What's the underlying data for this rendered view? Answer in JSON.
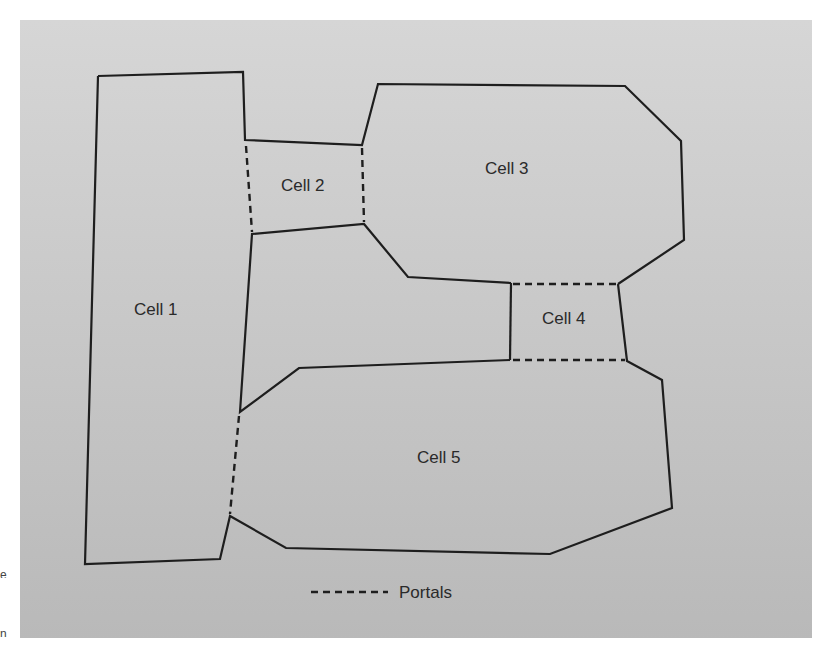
{
  "figure": {
    "background": "#c9c9c9",
    "stroke_color": "#1e1e1e",
    "text_color": "#2a2a2a"
  },
  "cells": [
    {
      "id": "cell-1",
      "label": "Cell 1",
      "label_pos": [
        162,
        309
      ],
      "polygon": [
        [
          98,
          76
        ],
        [
          243,
          72
        ],
        [
          245,
          145
        ],
        [
          252,
          234
        ],
        [
          240,
          412
        ],
        [
          230,
          516
        ],
        [
          220,
          559
        ],
        [
          85,
          564
        ]
      ]
    },
    {
      "id": "cell-2",
      "label": "Cell 2",
      "label_pos": [
        309,
        185
      ],
      "polygon": [
        [
          245,
          140
        ],
        [
          362,
          145
        ],
        [
          364,
          224
        ],
        [
          252,
          234
        ]
      ]
    },
    {
      "id": "cell-3",
      "label": "Cell 3",
      "label_pos": [
        513,
        168
      ],
      "polygon": [
        [
          378,
          84
        ],
        [
          625,
          86
        ],
        [
          681,
          141
        ],
        [
          684,
          240
        ],
        [
          618,
          284
        ],
        [
          511,
          283
        ],
        [
          408,
          277
        ],
        [
          364,
          224
        ],
        [
          362,
          145
        ]
      ]
    },
    {
      "id": "cell-4",
      "label": "Cell 4",
      "label_pos": [
        569,
        318
      ],
      "polygon": [
        [
          511,
          283
        ],
        [
          618,
          284
        ],
        [
          627,
          361
        ],
        [
          510,
          360
        ]
      ]
    },
    {
      "id": "cell-5",
      "label": "Cell 5",
      "label_pos": [
        445,
        457
      ],
      "polygon": [
        [
          240,
          412
        ],
        [
          299,
          368
        ],
        [
          510,
          360
        ],
        [
          627,
          361
        ],
        [
          662,
          380
        ],
        [
          672,
          508
        ],
        [
          550,
          554
        ],
        [
          286,
          548
        ],
        [
          230,
          516
        ]
      ]
    }
  ],
  "walls": [
    [
      [
        98,
        76
      ],
      [
        243,
        72
      ],
      [
        245,
        140
      ],
      [
        362,
        145
      ],
      [
        378,
        84
      ],
      [
        625,
        86
      ],
      [
        681,
        141
      ],
      [
        684,
        240
      ],
      [
        618,
        284
      ]
    ],
    [
      [
        511,
        283
      ],
      [
        408,
        277
      ],
      [
        364,
        224
      ],
      [
        252,
        234
      ],
      [
        240,
        412
      ],
      [
        299,
        368
      ],
      [
        510,
        360
      ]
    ],
    [
      [
        511,
        283
      ],
      [
        510,
        360
      ]
    ],
    [
      [
        618,
        284
      ],
      [
        627,
        361
      ],
      [
        662,
        380
      ],
      [
        672,
        508
      ],
      [
        550,
        554
      ],
      [
        286,
        548
      ],
      [
        230,
        516
      ],
      [
        220,
        559
      ],
      [
        85,
        564
      ],
      [
        98,
        76
      ]
    ]
  ],
  "portals": [
    {
      "id": "portal-1-2",
      "from": [
        246,
        146
      ],
      "to": [
        252,
        232
      ]
    },
    {
      "id": "portal-2-3",
      "from": [
        362,
        148
      ],
      "to": [
        364,
        222
      ]
    },
    {
      "id": "portal-3-4",
      "from": [
        513,
        284
      ],
      "to": [
        616,
        284
      ]
    },
    {
      "id": "portal-4-5",
      "from": [
        513,
        360
      ],
      "to": [
        625,
        360
      ]
    },
    {
      "id": "portal-1-5",
      "from": [
        239,
        416
      ],
      "to": [
        230,
        514
      ]
    }
  ],
  "legend": {
    "label": "Portals",
    "swatch": "dashed-line",
    "line_from": [
      311,
      592
    ],
    "line_to": [
      388,
      592
    ],
    "label_pos": [
      399,
      598
    ]
  },
  "edge_fragments": [
    "e",
    "n"
  ]
}
